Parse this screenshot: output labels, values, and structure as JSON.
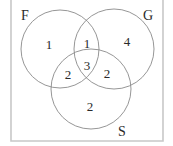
{
  "diagram": {
    "type": "venn",
    "sets": [
      {
        "id": "F",
        "label": "F"
      },
      {
        "id": "G",
        "label": "G"
      },
      {
        "id": "S",
        "label": "S"
      }
    ],
    "regions": {
      "F_only": "1",
      "G_only": "4",
      "S_only": "2",
      "F_and_G_only": "1",
      "F_and_S_only": "2",
      "G_and_S_only": "2",
      "F_and_G_and_S": "3"
    },
    "colors": {
      "frame": "#c8c8c8",
      "circle_stroke": "#8a8a8a",
      "text": "#2a2a2a",
      "background": "#ffffff"
    }
  }
}
